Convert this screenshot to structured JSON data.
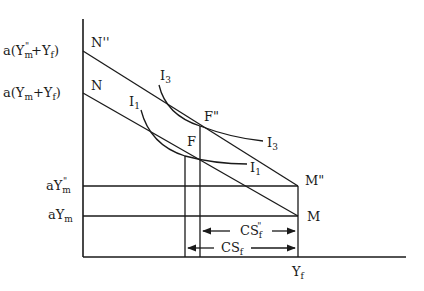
{
  "diagram": {
    "type": "economics-budget-line-indifference",
    "y_axis_labels": {
      "top": {
        "base": "a(Y",
        "sub": "m",
        "sup": "\"",
        "rest": "+Y",
        "rest_sub": "f",
        "close": ")"
      },
      "second": {
        "base": "a(Y",
        "sub": "m",
        "rest": "+Y",
        "rest_sub": "f",
        "close": ")"
      },
      "third": {
        "base": "aY",
        "sub": "m",
        "sup": "\""
      },
      "fourth": {
        "base": "aY",
        "sub": "m"
      }
    },
    "points": {
      "N2": "N''",
      "N": "N",
      "F2": "F\"",
      "F": "F",
      "M2": "M\"",
      "M": "M"
    },
    "curves": {
      "I3_top": "I",
      "I3_top_sub": "3",
      "I3_end": "I",
      "I3_end_sub": "3",
      "I1_top": "I",
      "I1_top_sub": "1",
      "I1_end": "I",
      "I1_end_sub": "1"
    },
    "arrows": {
      "cs2": {
        "base": "CS",
        "sub": "f",
        "sup": "\""
      },
      "cs": {
        "base": "CS",
        "sub": "f"
      }
    },
    "x_axis_label": {
      "base": "Y",
      "sub": "f"
    }
  }
}
